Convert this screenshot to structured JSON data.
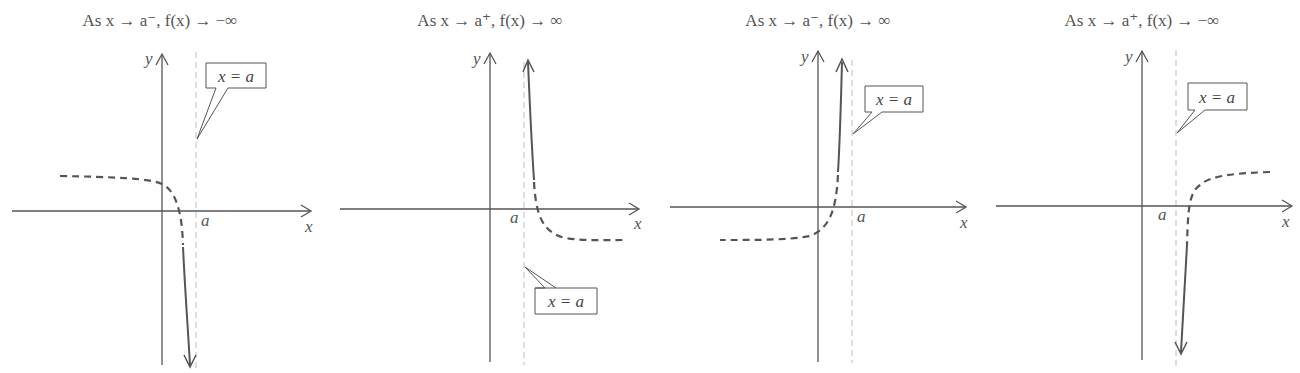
{
  "figure": {
    "panels": [
      {
        "title": "As x → a⁻, f(x) → −∞",
        "title_parts": {
          "prefix": "As ",
          "var": "x",
          "arrow1": " → ",
          "limit": "a⁻",
          "sep": ", ",
          "func": "f(x)",
          "arrow2": " → ",
          "result": "−∞"
        },
        "x_axis_label": "x",
        "y_axis_label": "y",
        "asymptote_tick_label": "a",
        "callout_label": "x = a",
        "callout_position": "above",
        "behavior": "left side approaches -infinity"
      },
      {
        "title": "As x → a⁺, f(x) → ∞",
        "title_parts": {
          "prefix": "As ",
          "var": "x",
          "arrow1": " → ",
          "limit": "a⁺",
          "sep": ", ",
          "func": "f(x)",
          "arrow2": "→",
          "result": "∞"
        },
        "x_axis_label": "x",
        "y_axis_label": "y",
        "asymptote_tick_label": "a",
        "callout_label": "x = a",
        "callout_position": "below",
        "behavior": "right side approaches +infinity"
      },
      {
        "title": "As x → a⁻, f(x) → ∞",
        "title_parts": {
          "prefix": "As ",
          "var": "x",
          "arrow1": " → ",
          "limit": "a⁻",
          "sep": ", ",
          "func": "f(x)",
          "arrow2": " → ",
          "result": "∞"
        },
        "x_axis_label": "x",
        "y_axis_label": "y",
        "asymptote_tick_label": "a",
        "callout_label": "x = a",
        "callout_position": "above",
        "behavior": "left side approaches +infinity"
      },
      {
        "title": "As x → a⁺, f(x) → −∞",
        "title_parts": {
          "prefix": "As ",
          "var": "x",
          "arrow1": " → ",
          "limit": "a⁺",
          "sep": ", ",
          "func": "f(x)",
          "arrow2": "→",
          "result": "−∞"
        },
        "x_axis_label": "x",
        "y_axis_label": "y",
        "asymptote_tick_label": "a",
        "callout_label": "x = a",
        "callout_position": "above",
        "behavior": "right side approaches -infinity"
      }
    ],
    "colors": {
      "axis": "#555555",
      "curve": "#555555",
      "asymptote": "#bbbbbb",
      "text": "#555555"
    }
  }
}
